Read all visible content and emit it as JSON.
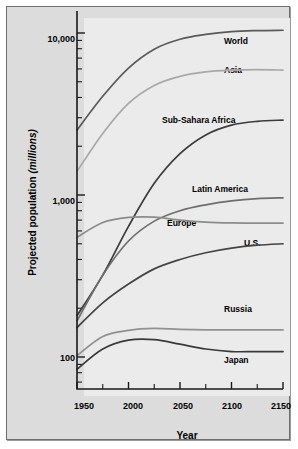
{
  "chart_data": {
    "type": "line",
    "title": "",
    "xlabel": "Year",
    "ylabel": "Projected population (millions)",
    "ylabel_main": "Projected population",
    "ylabel_unit": "(millions)",
    "yscale": "log",
    "ylim": [
      60,
      20000
    ],
    "xlim": [
      1950,
      2150
    ],
    "grid": false,
    "legend_position": "inline-right-of-curves",
    "y_tick_labels": [
      "10,000",
      "1,000",
      "100"
    ],
    "y_tick_values": [
      10000,
      1000,
      100
    ],
    "x_tick_labels": [
      "1950",
      "2000",
      "2050",
      "2100",
      "2150"
    ],
    "x_tick_values": [
      1950,
      2000,
      2050,
      2100,
      2150
    ],
    "x_minor_step": 25,
    "x": [
      1950,
      1975,
      2000,
      2025,
      2050,
      2075,
      2100,
      2125,
      2150
    ],
    "series": [
      {
        "name": "World",
        "color": "#5a5a5a",
        "label": "World",
        "values": [
          2520,
          4070,
          6080,
          7950,
          9150,
          9800,
          10200,
          10350,
          10400
        ]
      },
      {
        "name": "Asia",
        "color": "#a8a8a8",
        "label": "Asia",
        "values": [
          1400,
          2400,
          3680,
          4750,
          5400,
          5750,
          5900,
          5950,
          5900
        ]
      },
      {
        "name": "Sub-Sahara Africa",
        "color": "#3c3c3c",
        "label": "Sub-Sahara Africa",
        "values": [
          180,
          320,
          640,
          1180,
          1800,
          2350,
          2700,
          2850,
          2900
        ]
      },
      {
        "name": "Latin America",
        "color": "#6e6e6e",
        "label": "Latin America",
        "values": [
          167,
          320,
          520,
          690,
          800,
          870,
          920,
          950,
          960
        ]
      },
      {
        "name": "Europe",
        "color": "#8c8c8c",
        "label": "Europe",
        "values": [
          548,
          676,
          727,
          730,
          700,
          680,
          672,
          670,
          670
        ]
      },
      {
        "name": "U.S.",
        "color": "#444444",
        "label": "U.S.",
        "values": [
          152,
          216,
          282,
          350,
          400,
          440,
          470,
          490,
          500
        ]
      },
      {
        "name": "Russia",
        "color": "#909090",
        "label": "Russia",
        "values": [
          102,
          134,
          146,
          150,
          148,
          147,
          147,
          147,
          147
        ]
      },
      {
        "name": "Japan",
        "color": "#3a3a3a",
        "label": "Japan",
        "values": [
          84,
          112,
          127,
          128,
          120,
          112,
          108,
          108,
          108
        ]
      }
    ]
  }
}
